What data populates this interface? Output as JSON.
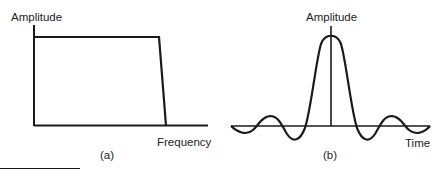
{
  "panel_a": {
    "y_label": "Amplitude",
    "x_label": "Frequency",
    "caption": "(a)"
  },
  "panel_b": {
    "y_label": "Amplitude",
    "x_label": "Time",
    "caption": "(b)"
  },
  "stroke_color": "#1a1a1a"
}
